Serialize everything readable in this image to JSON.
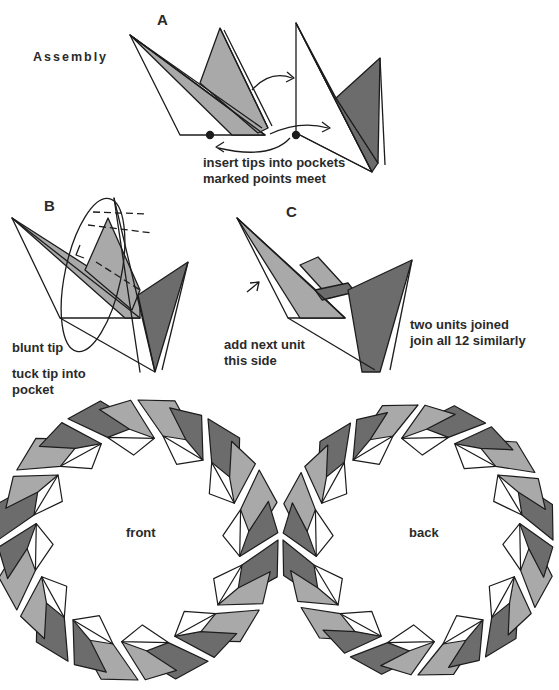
{
  "title": "Assembly",
  "colors": {
    "light": "#a9a9a9",
    "dark": "#6c6c6c",
    "line": "#1c1c1c",
    "paper": "#ffffff"
  },
  "steps": {
    "a": {
      "label": "A",
      "caption_line1": "insert tips into pockets",
      "caption_line2": "marked points meet"
    },
    "b": {
      "label": "B",
      "note1": "blunt tip",
      "note2_line1": "tuck tip into",
      "note2_line2": "pocket"
    },
    "c": {
      "label": "C",
      "note1_line1": "add next unit",
      "note1_line2": "this side",
      "note2_line1": "two units joined",
      "note2_line2": "join all 12 similarly"
    }
  },
  "wreaths": {
    "front_label": "front",
    "back_label": "back",
    "unit_count": 12
  }
}
